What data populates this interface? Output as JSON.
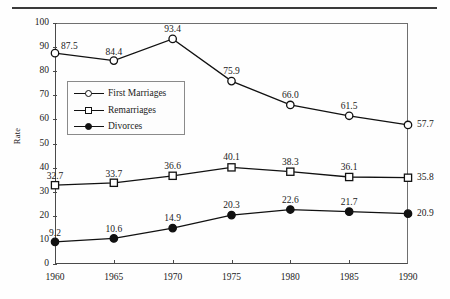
{
  "chart_data": {
    "type": "line",
    "title": "",
    "xlabel": "",
    "ylabel": "Rate",
    "x": [
      1960,
      1965,
      1970,
      1975,
      1980,
      1985,
      1990
    ],
    "categories": [
      "1960",
      "1965",
      "1970",
      "1975",
      "1980",
      "1985",
      "1990"
    ],
    "xlim": [
      1960,
      1990
    ],
    "ylim": [
      0,
      100
    ],
    "yticks": [
      "0",
      "10",
      "20",
      "30",
      "40",
      "50",
      "60",
      "70",
      "80",
      "90",
      "100"
    ],
    "xticks": [
      "1960",
      "1965",
      "1970",
      "1975",
      "1980",
      "1985",
      "1990"
    ],
    "grid": false,
    "legend_position": "upper-left-inside",
    "data_labels": true,
    "series": [
      {
        "name": "First Marriages",
        "marker": "open-circle",
        "color": "#111111",
        "values": [
          87.5,
          84.4,
          93.4,
          75.9,
          66.0,
          61.5,
          57.7
        ],
        "labels": [
          "87.5",
          "84.4",
          "93.4",
          "75.9",
          "66.0",
          "61.5",
          "57.7"
        ]
      },
      {
        "name": "Remarriages",
        "marker": "open-square",
        "color": "#111111",
        "values": [
          32.7,
          33.7,
          36.6,
          40.1,
          38.3,
          36.1,
          35.8
        ],
        "labels": [
          "32.7",
          "33.7",
          "36.6",
          "40.1",
          "38.3",
          "36.1",
          "35.8"
        ]
      },
      {
        "name": "Divorces",
        "marker": "filled-circle",
        "color": "#111111",
        "values": [
          9.2,
          10.6,
          14.9,
          20.3,
          22.6,
          21.7,
          20.9
        ],
        "labels": [
          "9.2",
          "10.6",
          "14.9",
          "20.3",
          "22.6",
          "21.7",
          "20.9"
        ]
      }
    ]
  },
  "legend": {
    "items": [
      {
        "label": "First Marriages"
      },
      {
        "label": "Remarriages"
      },
      {
        "label": "Divorces"
      }
    ]
  }
}
